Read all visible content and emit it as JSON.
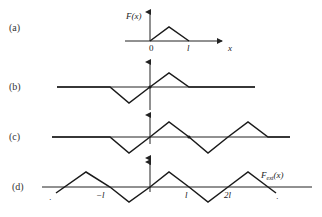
{
  "panels": [
    {
      "id": "a",
      "label": "(a)",
      "ylabel": "F(x)",
      "tick_0": "0",
      "tick_l": "l",
      "xlabel": "x"
    },
    {
      "id": "b",
      "label": "(b)"
    },
    {
      "id": "c",
      "label": "(c)"
    },
    {
      "id": "d",
      "label": "(d)",
      "tick_neg_l": "−l",
      "tick_l": "l",
      "tick_2l": "2l",
      "curve_label_main": "F",
      "curve_label_sub": "ext",
      "curve_label_arg": "(x)",
      "ellipsis_left": "·",
      "ellipsis_right": "·"
    }
  ],
  "colors": {
    "line": "#1a1a1a",
    "background": "#ffffff"
  }
}
